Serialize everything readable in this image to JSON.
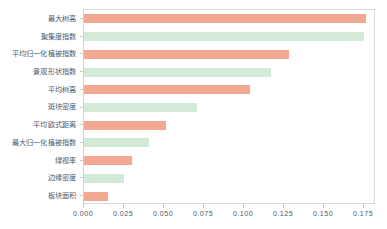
{
  "chart_data": {
    "type": "bar",
    "orientation": "horizontal",
    "title": "",
    "subtitle": "",
    "xlabel": "",
    "ylabel": "",
    "xlim": [
      0.0,
      0.1825
    ],
    "grid": false,
    "legend": null,
    "xticks": [
      "0.000",
      "0.025",
      "0.050",
      "0.075",
      "0.100",
      "0.125",
      "0.150",
      "0.175"
    ],
    "xtick_values": [
      0.0,
      0.025,
      0.05,
      0.075,
      0.1,
      0.125,
      0.15,
      0.175
    ],
    "categories": [
      "最大树高",
      "聚集度指数",
      "平均归一化植被指数",
      "景观形状指数",
      "平均树高",
      "斑块密度",
      "平均欧式距离",
      "最大归一化植被指数",
      "绿视率",
      "边缘密度",
      "板块面积"
    ],
    "values": [
      0.176,
      0.175,
      0.128,
      0.117,
      0.104,
      0.0705,
      0.0512,
      0.0405,
      0.03,
      0.025,
      0.015
    ],
    "colors": [
      "#f3a894",
      "#d4ead9",
      "#f3a894",
      "#d4ead9",
      "#f3a894",
      "#d4ead9",
      "#f3a894",
      "#d4ead9",
      "#f3a894",
      "#d4ead9",
      "#f3a894"
    ],
    "palette": {
      "bar_salmon": "#f3a894",
      "bar_mint": "#d4ead9",
      "axis_text": "#4d5b6b",
      "frame": "#d9d9d9",
      "background": "#ffffff"
    }
  }
}
